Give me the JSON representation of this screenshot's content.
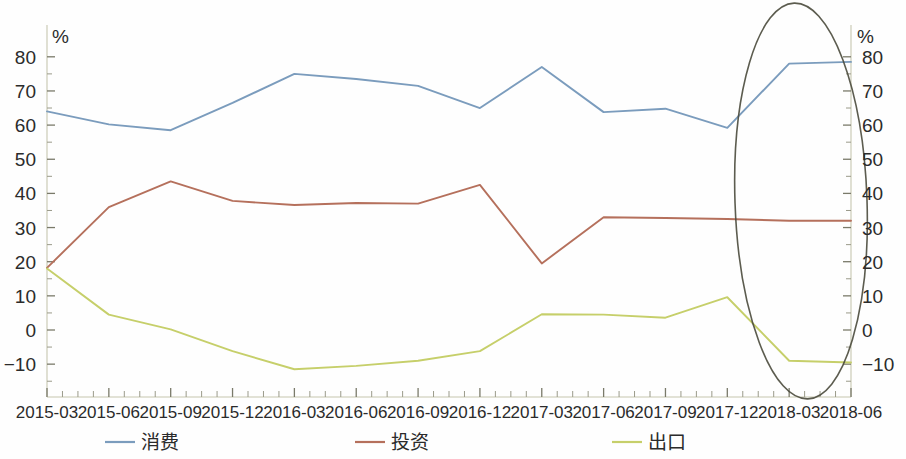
{
  "chart_data": {
    "type": "line",
    "title": "",
    "xlabel": "",
    "ylabel": "%",
    "ylabel_right": "%",
    "ylim": [
      -15,
      84
    ],
    "yticks": [
      -10,
      0,
      10,
      20,
      30,
      40,
      50,
      60,
      70,
      80
    ],
    "ytick_labels": [
      "−10",
      "0",
      "10",
      "20",
      "30",
      "40",
      "50",
      "60",
      "70",
      "80"
    ],
    "grid": false,
    "legend_position": "bottom",
    "categories": [
      "2015-03",
      "2015-06",
      "2015-09",
      "2015-12",
      "2016-03",
      "2016-06",
      "2016-09",
      "2016-12",
      "2017-03",
      "2017-06",
      "2017-09",
      "2017-12",
      "2018-03",
      "2018-06"
    ],
    "series": [
      {
        "name": "消费",
        "color": "#7b9cbd",
        "values": [
          64.0,
          60.2,
          58.5,
          66.5,
          75.0,
          73.5,
          71.5,
          65.0,
          77.0,
          63.8,
          64.8,
          59.2,
          78.0,
          78.5
        ]
      },
      {
        "name": "投资",
        "color": "#b5705c",
        "values": [
          18.2,
          36.0,
          43.5,
          37.8,
          36.6,
          37.2,
          37.0,
          42.5,
          19.5,
          33.0,
          32.8,
          32.5,
          32.0,
          32.0
        ]
      },
      {
        "name": "出口",
        "color": "#c6cf6a",
        "values": [
          18.0,
          4.5,
          0.2,
          -6.2,
          -11.5,
          -10.5,
          -9.0,
          -6.2,
          4.6,
          4.5,
          3.6,
          9.6,
          -9.0,
          -9.5
        ]
      }
    ],
    "annotations": [
      {
        "type": "ellipse",
        "name": "highlight-ellipse",
        "covers": [
          "2017-12",
          "2018-03",
          "2018-06"
        ]
      }
    ]
  },
  "legend": {
    "items": [
      {
        "label": "消费",
        "color": "#7b9cbd"
      },
      {
        "label": "投资",
        "color": "#b5705c"
      },
      {
        "label": "出口",
        "color": "#c6cf6a"
      }
    ]
  },
  "axes": {
    "left_unit": "%",
    "right_unit": "%"
  }
}
